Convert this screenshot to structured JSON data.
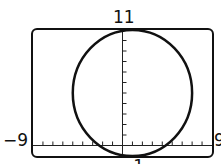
{
  "window": {
    "xmin": "−9",
    "xmax": "9",
    "ymin": "−1",
    "ymax": "11"
  },
  "chart_data": {
    "type": "line",
    "title": "",
    "xlabel": "",
    "ylabel": "",
    "xlim": [
      -9,
      9
    ],
    "ylim": [
      -1,
      11
    ],
    "x_tick_step": 1,
    "y_tick_step": 1,
    "grid": false,
    "series": [
      {
        "name": "circle",
        "shape": "circle",
        "center": [
          1,
          5
        ],
        "radius": 6,
        "equation": "(x-1)^2 + (y-5)^2 = 36"
      }
    ],
    "tick_labels": {
      "left": "−9",
      "right": "9",
      "top": "11",
      "bottom": "−1"
    }
  }
}
